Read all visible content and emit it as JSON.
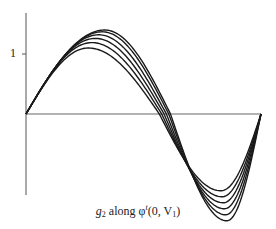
{
  "chart_data": {
    "type": "line",
    "title": "",
    "caption": {
      "prefix": "g",
      "prefix_sub": "2",
      "middle": " along ",
      "phi": "φ",
      "phi_sup": "t",
      "args_open": "(0, V",
      "args_sub": "1",
      "args_close": ")"
    },
    "xlabel": "",
    "ylabel": "",
    "y_ticks": [
      {
        "value": 1,
        "label": "1"
      }
    ],
    "grid": false,
    "legend": null,
    "axes": {
      "x_axis_at_y": 0,
      "xlim": [
        0,
        1
      ],
      "ylim": [
        -1.95,
        1.45
      ]
    },
    "series": [
      {
        "name": "curve-1",
        "peak": 1.1,
        "peak_x": 0.265,
        "trough": -1.28,
        "trough_x": 0.83
      },
      {
        "name": "curve-2",
        "peak": 1.19,
        "peak_x": 0.28,
        "trough": -1.38,
        "trough_x": 0.835
      },
      {
        "name": "curve-3",
        "peak": 1.26,
        "peak_x": 0.295,
        "trough": -1.48,
        "trough_x": 0.84
      },
      {
        "name": "curve-4",
        "peak": 1.32,
        "peak_x": 0.31,
        "trough": -1.58,
        "trough_x": 0.845
      },
      {
        "name": "curve-5",
        "peak": 1.37,
        "peak_x": 0.325,
        "trough": -1.68,
        "trough_x": 0.85
      },
      {
        "name": "curve-6",
        "peak": 1.4,
        "peak_x": 0.335,
        "trough": -1.78,
        "trough_x": 0.855
      }
    ],
    "style": {
      "line_color": "#1a1a1a",
      "axis_color": "#555555"
    }
  }
}
